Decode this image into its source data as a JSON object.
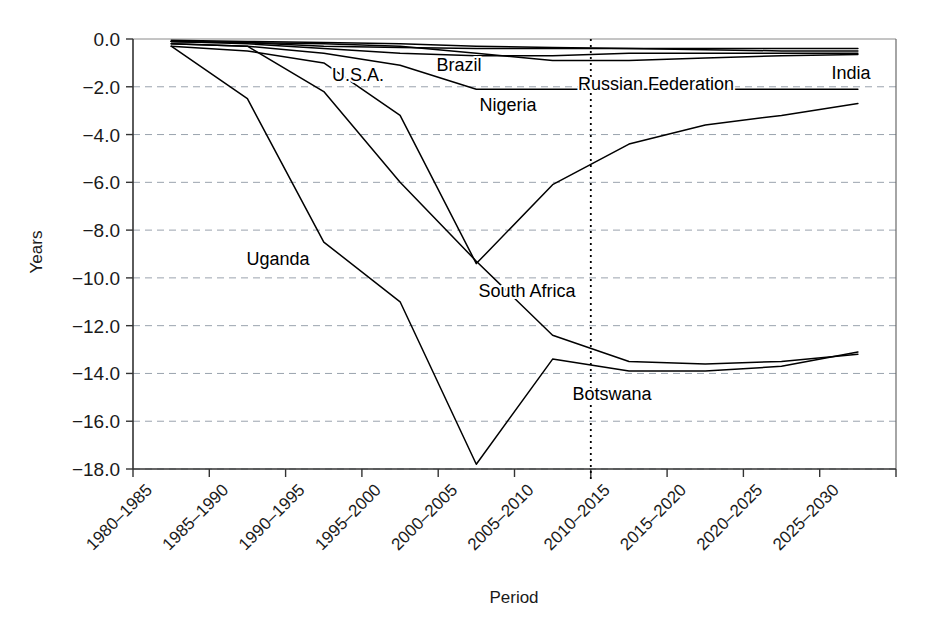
{
  "chart_data": {
    "type": "line",
    "title": "",
    "xlabel": "Period",
    "ylabel": "Years",
    "ylim": [
      -18.0,
      0.0
    ],
    "ytick_labels": [
      "0.0",
      "−2.0",
      "−4.0",
      "−6.0",
      "−8.0",
      "−10.0",
      "−12.0",
      "−14.0",
      "−16.0",
      "−18.0"
    ],
    "ytick_values": [
      0,
      -2,
      -4,
      -6,
      -8,
      -10,
      -12,
      -14,
      -16,
      -18
    ],
    "grid": "horizontal-dashed",
    "legend": "inline-labels",
    "categories": [
      "1980–1985",
      "1985–1990",
      "1990–1995",
      "1995–2000",
      "2000–2005",
      "2005–2010",
      "2010–2015",
      "2015–2020",
      "2020–2025",
      "2025–2030"
    ],
    "projection_divider": {
      "after_category": "2005–2010",
      "style": "dotted-vertical"
    },
    "series": [
      {
        "name": "Botswana",
        "values": [
          -0.3,
          -2.5,
          -8.5,
          -11.0,
          -17.8,
          -13.4,
          -13.9,
          -13.9,
          -13.7,
          -13.1
        ]
      },
      {
        "name": "South Africa",
        "values": [
          -0.2,
          -0.3,
          -2.2,
          -6.0,
          -9.3,
          -12.4,
          -13.5,
          -13.6,
          -13.5,
          -13.2
        ]
      },
      {
        "name": "Uganda",
        "values": [
          -0.3,
          -0.5,
          -1.0,
          -3.2,
          -9.4,
          -6.1,
          -4.4,
          -3.6,
          -3.2,
          -2.7
        ]
      },
      {
        "name": "Nigeria",
        "values": [
          -0.2,
          -0.3,
          -0.6,
          -1.1,
          -2.1,
          -2.1,
          -2.1,
          -2.1,
          -2.1,
          -2.1
        ]
      },
      {
        "name": "Russian Federation",
        "values": [
          -0.1,
          -0.15,
          -0.2,
          -0.3,
          -0.6,
          -0.9,
          -0.9,
          -0.8,
          -0.7,
          -0.65
        ]
      },
      {
        "name": "Brazil",
        "values": [
          -0.1,
          -0.2,
          -0.4,
          -0.6,
          -0.7,
          -0.7,
          -0.6,
          -0.6,
          -0.6,
          -0.6
        ]
      },
      {
        "name": "U.S.A.",
        "values": [
          -0.1,
          -0.15,
          -0.3,
          -0.35,
          -0.4,
          -0.4,
          -0.4,
          -0.4,
          -0.4,
          -0.4
        ]
      },
      {
        "name": "India",
        "values": [
          -0.05,
          -0.1,
          -0.15,
          -0.2,
          -0.3,
          -0.35,
          -0.4,
          -0.45,
          -0.5,
          -0.5
        ]
      }
    ],
    "annotations": [
      {
        "text": "Uganda",
        "x": 278,
        "y": 265
      },
      {
        "text": "U.S.A.",
        "x": 358,
        "y": 81
      },
      {
        "text": "Brazil",
        "x": 459,
        "y": 71
      },
      {
        "text": "Nigeria",
        "x": 508,
        "y": 111
      },
      {
        "text": "Russian Federation",
        "x": 656,
        "y": 90
      },
      {
        "text": "India",
        "x": 851,
        "y": 79
      },
      {
        "text": "South Africa",
        "x": 527,
        "y": 297
      },
      {
        "text": "Botswana",
        "x": 612,
        "y": 400
      }
    ]
  }
}
